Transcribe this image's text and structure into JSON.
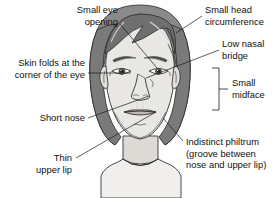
{
  "figure": {
    "background_color": "#ffffff",
    "ink_color": "#2b2b2b",
    "skin_color": "#e8e6e3",
    "hair_color": "#8c8c8c",
    "hair_shadow_color": "#6e6e6e",
    "shirt_color": "#f0efed"
  },
  "labels": [
    {
      "id": "small-eye-opening",
      "line1": "Small eye",
      "line2": "opening",
      "align": "right",
      "text_x": 118,
      "text_y": 13,
      "line_height": 11.5
    },
    {
      "id": "skin-folds-corner-eye",
      "line1": "Skin folds at the",
      "line2": "corner of the eye",
      "align": "right",
      "text_x": 85,
      "text_y": 66,
      "line_height": 11.5
    },
    {
      "id": "short-nose",
      "line1": "Short nose",
      "line2": "",
      "align": "right",
      "text_x": 85,
      "text_y": 121,
      "line_height": 11.5
    },
    {
      "id": "thin-upper-lip",
      "line1": "Thin",
      "line2": "upper lip",
      "align": "right",
      "text_x": 72,
      "text_y": 161,
      "line_height": 11.5
    },
    {
      "id": "small-head-circumference",
      "line1": "Small head",
      "line2": "circumference",
      "align": "left",
      "text_x": 205,
      "text_y": 13,
      "line_height": 11.5
    },
    {
      "id": "low-nasal-bridge",
      "line1": "Low nasal",
      "line2": "bridge",
      "align": "left",
      "text_x": 222,
      "text_y": 47,
      "line_height": 11.5
    },
    {
      "id": "small-midface",
      "line1": "Small",
      "line2": "midface",
      "align": "left",
      "text_x": 232,
      "text_y": 83,
      "line_height": 11.5
    },
    {
      "id": "indistinct-philtrum",
      "line1": "Indistinct philtrum",
      "line2": "(groove between",
      "line3": "nose and upper lip)",
      "align": "left",
      "text_x": 186,
      "text_y": 145,
      "line_height": 11.5
    }
  ],
  "icons": {
    "bracket": "curly-bracket-icon",
    "leader": "leader-line-icon"
  }
}
